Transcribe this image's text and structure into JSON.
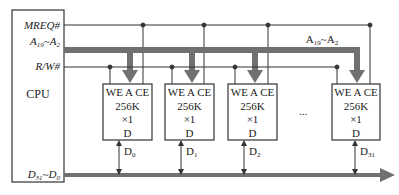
{
  "diagram": {
    "cpu": {
      "label": "CPU",
      "signals": {
        "mreq": "MREQ#",
        "addr": {
          "main": "A",
          "hi_sub": "19",
          "sep": "~",
          "lo_main": "A",
          "lo_sub": "2"
        },
        "rw": "R/W#",
        "data": {
          "main": "D",
          "hi_sub": "31",
          "sep": "~",
          "lo_main": "D",
          "lo_sub": "0"
        }
      }
    },
    "address_bus_label": {
      "main": "A",
      "hi_sub": "19",
      "sep": "~",
      "lo_main": "A",
      "lo_sub": "2"
    },
    "chips": [
      {
        "pins": "WE A CE",
        "size": "256K",
        "width": "×1",
        "out": "D",
        "data_label": "D",
        "data_sub": "0"
      },
      {
        "pins": "WE A CE",
        "size": "256K",
        "width": "×1",
        "out": "D",
        "data_label": "D",
        "data_sub": "1"
      },
      {
        "pins": "WE A CE",
        "size": "256K",
        "width": "×1",
        "out": "D",
        "data_label": "D",
        "data_sub": "2"
      },
      {
        "pins": "WE A CE",
        "size": "256K",
        "width": "×1",
        "out": "D",
        "data_label": "D",
        "data_sub": "31"
      }
    ],
    "ellipsis": "...",
    "colors": {
      "line": "#333333",
      "bus": "#707070"
    }
  }
}
